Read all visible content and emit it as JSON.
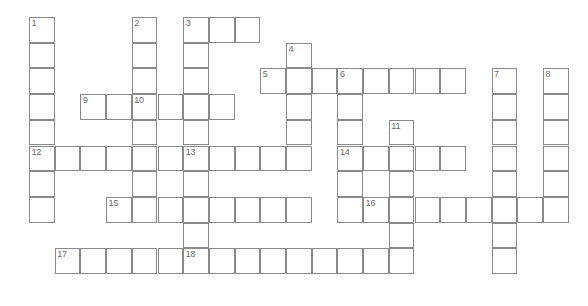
{
  "puzzle": {
    "title": "Crossword Puzzle Grid",
    "type": "crossword",
    "grid_columns": 22,
    "grid_rows": 11,
    "cell_size_px": 25.7,
    "origin_x_px": 29,
    "origin_y_px": 17,
    "line_color": "#8a8a8a",
    "cell_fill": "#ffffff",
    "number_color": "#6a6a6a",
    "background": "#ffffff",
    "numbered_clues": [
      {
        "number": "1",
        "direction": "down",
        "col": 0,
        "row": 0,
        "length": 8
      },
      {
        "number": "2",
        "direction": "down",
        "col": 4,
        "row": 0,
        "length": 5
      },
      {
        "number": "3",
        "direction": "across",
        "col": 6,
        "row": 0,
        "length": 3
      },
      {
        "number": "3",
        "direction": "down",
        "col": 6,
        "row": 0,
        "length": 5
      },
      {
        "number": "4",
        "direction": "down",
        "col": 10,
        "row": 1,
        "length": 6
      },
      {
        "number": "5",
        "direction": "across",
        "col": 9,
        "row": 2,
        "length": 8
      },
      {
        "number": "6",
        "direction": "down",
        "col": 12,
        "row": 2,
        "length": 6
      },
      {
        "number": "7",
        "direction": "down",
        "col": 18,
        "row": 2,
        "length": 8
      },
      {
        "number": "8",
        "direction": "down",
        "col": 20,
        "row": 2,
        "length": 6
      },
      {
        "number": "9",
        "across": "across",
        "direction": "across",
        "col": 2,
        "row": 3,
        "length": 6
      },
      {
        "number": "10",
        "direction": "down",
        "col": 4,
        "row": 3,
        "length": 8
      },
      {
        "number": "11",
        "direction": "down",
        "col": 14,
        "row": 4,
        "length": 7
      },
      {
        "number": "12",
        "direction": "across",
        "col": 0,
        "row": 5,
        "length": 6
      },
      {
        "number": "13",
        "direction": "across",
        "col": 6,
        "row": 5,
        "length": 5
      },
      {
        "number": "13",
        "direction": "down",
        "col": 6,
        "row": 5,
        "length": 6
      },
      {
        "number": "14",
        "direction": "across",
        "col": 12,
        "row": 5,
        "length": 5
      },
      {
        "number": "15",
        "direction": "across",
        "col": 3,
        "row": 7,
        "length": 8
      },
      {
        "number": "16",
        "direction": "across",
        "col": 13,
        "row": 7,
        "length": 7
      },
      {
        "number": "17",
        "direction": "across",
        "col": 1,
        "row": 9,
        "length": 5
      },
      {
        "number": "18",
        "direction": "across",
        "col": 6,
        "row": 9,
        "length": 9
      }
    ],
    "cells": [
      {
        "col": 0,
        "row": 0,
        "num": "1"
      },
      {
        "col": 4,
        "row": 0,
        "num": "2"
      },
      {
        "col": 6,
        "row": 0,
        "num": "3"
      },
      {
        "col": 7,
        "row": 0,
        "num": ""
      },
      {
        "col": 8,
        "row": 0,
        "num": ""
      },
      {
        "col": 0,
        "row": 1,
        "num": ""
      },
      {
        "col": 4,
        "row": 1,
        "num": ""
      },
      {
        "col": 6,
        "row": 1,
        "num": ""
      },
      {
        "col": 10,
        "row": 1,
        "num": "4"
      },
      {
        "col": 0,
        "row": 2,
        "num": ""
      },
      {
        "col": 4,
        "row": 2,
        "num": ""
      },
      {
        "col": 6,
        "row": 2,
        "num": ""
      },
      {
        "col": 9,
        "row": 2,
        "num": "5"
      },
      {
        "col": 10,
        "row": 2,
        "num": ""
      },
      {
        "col": 11,
        "row": 2,
        "num": ""
      },
      {
        "col": 12,
        "row": 2,
        "num": "6"
      },
      {
        "col": 13,
        "row": 2,
        "num": ""
      },
      {
        "col": 14,
        "row": 2,
        "num": ""
      },
      {
        "col": 15,
        "row": 2,
        "num": ""
      },
      {
        "col": 16,
        "row": 2,
        "num": ""
      },
      {
        "col": 18,
        "row": 2,
        "num": "7"
      },
      {
        "col": 20,
        "row": 2,
        "num": "8"
      },
      {
        "col": 0,
        "row": 3,
        "num": ""
      },
      {
        "col": 2,
        "row": 3,
        "num": "9"
      },
      {
        "col": 3,
        "row": 3,
        "num": ""
      },
      {
        "col": 4,
        "row": 3,
        "num": "10"
      },
      {
        "col": 5,
        "row": 3,
        "num": ""
      },
      {
        "col": 6,
        "row": 3,
        "num": ""
      },
      {
        "col": 7,
        "row": 3,
        "num": ""
      },
      {
        "col": 10,
        "row": 3,
        "num": ""
      },
      {
        "col": 12,
        "row": 3,
        "num": ""
      },
      {
        "col": 18,
        "row": 3,
        "num": ""
      },
      {
        "col": 20,
        "row": 3,
        "num": ""
      },
      {
        "col": 0,
        "row": 4,
        "num": ""
      },
      {
        "col": 4,
        "row": 4,
        "num": ""
      },
      {
        "col": 6,
        "row": 4,
        "num": ""
      },
      {
        "col": 10,
        "row": 4,
        "num": ""
      },
      {
        "col": 12,
        "row": 4,
        "num": ""
      },
      {
        "col": 14,
        "row": 4,
        "num": "11"
      },
      {
        "col": 18,
        "row": 4,
        "num": ""
      },
      {
        "col": 20,
        "row": 4,
        "num": ""
      },
      {
        "col": 0,
        "row": 5,
        "num": "12"
      },
      {
        "col": 1,
        "row": 5,
        "num": ""
      },
      {
        "col": 2,
        "row": 5,
        "num": ""
      },
      {
        "col": 3,
        "row": 5,
        "num": ""
      },
      {
        "col": 4,
        "row": 5,
        "num": ""
      },
      {
        "col": 5,
        "row": 5,
        "num": ""
      },
      {
        "col": 6,
        "row": 5,
        "num": "13"
      },
      {
        "col": 7,
        "row": 5,
        "num": ""
      },
      {
        "col": 8,
        "row": 5,
        "num": ""
      },
      {
        "col": 9,
        "row": 5,
        "num": ""
      },
      {
        "col": 10,
        "row": 5,
        "num": ""
      },
      {
        "col": 12,
        "row": 5,
        "num": "14"
      },
      {
        "col": 13,
        "row": 5,
        "num": ""
      },
      {
        "col": 14,
        "row": 5,
        "num": ""
      },
      {
        "col": 15,
        "row": 5,
        "num": ""
      },
      {
        "col": 16,
        "row": 5,
        "num": ""
      },
      {
        "col": 18,
        "row": 5,
        "num": ""
      },
      {
        "col": 20,
        "row": 5,
        "num": ""
      },
      {
        "col": 0,
        "row": 6,
        "num": ""
      },
      {
        "col": 4,
        "row": 6,
        "num": ""
      },
      {
        "col": 6,
        "row": 6,
        "num": ""
      },
      {
        "col": 12,
        "row": 6,
        "num": ""
      },
      {
        "col": 14,
        "row": 6,
        "num": ""
      },
      {
        "col": 18,
        "row": 6,
        "num": ""
      },
      {
        "col": 20,
        "row": 6,
        "num": ""
      },
      {
        "col": 0,
        "row": 7,
        "num": ""
      },
      {
        "col": 3,
        "row": 7,
        "num": "15"
      },
      {
        "col": 4,
        "row": 7,
        "num": ""
      },
      {
        "col": 5,
        "row": 7,
        "num": ""
      },
      {
        "col": 6,
        "row": 7,
        "num": ""
      },
      {
        "col": 7,
        "row": 7,
        "num": ""
      },
      {
        "col": 8,
        "row": 7,
        "num": ""
      },
      {
        "col": 9,
        "row": 7,
        "num": ""
      },
      {
        "col": 10,
        "row": 7,
        "num": ""
      },
      {
        "col": 12,
        "row": 7,
        "num": ""
      },
      {
        "col": 13,
        "row": 7,
        "num": "16"
      },
      {
        "col": 14,
        "row": 7,
        "num": ""
      },
      {
        "col": 15,
        "row": 7,
        "num": ""
      },
      {
        "col": 16,
        "row": 7,
        "num": ""
      },
      {
        "col": 17,
        "row": 7,
        "num": ""
      },
      {
        "col": 18,
        "row": 7,
        "num": ""
      },
      {
        "col": 19,
        "row": 7,
        "num": ""
      },
      {
        "col": 20,
        "row": 7,
        "num": ""
      },
      {
        "col": 6,
        "row": 8,
        "num": ""
      },
      {
        "col": 14,
        "row": 8,
        "num": ""
      },
      {
        "col": 18,
        "row": 8,
        "num": ""
      },
      {
        "col": 1,
        "row": 9,
        "num": "17"
      },
      {
        "col": 2,
        "row": 9,
        "num": ""
      },
      {
        "col": 3,
        "row": 9,
        "num": ""
      },
      {
        "col": 4,
        "row": 9,
        "num": ""
      },
      {
        "col": 5,
        "row": 9,
        "num": ""
      },
      {
        "col": 6,
        "row": 9,
        "num": "18"
      },
      {
        "col": 7,
        "row": 9,
        "num": ""
      },
      {
        "col": 8,
        "row": 9,
        "num": ""
      },
      {
        "col": 9,
        "row": 9,
        "num": ""
      },
      {
        "col": 10,
        "row": 9,
        "num": ""
      },
      {
        "col": 11,
        "row": 9,
        "num": ""
      },
      {
        "col": 12,
        "row": 9,
        "num": ""
      },
      {
        "col": 13,
        "row": 9,
        "num": ""
      },
      {
        "col": 14,
        "row": 9,
        "num": ""
      },
      {
        "col": 18,
        "row": 9,
        "num": ""
      }
    ]
  }
}
